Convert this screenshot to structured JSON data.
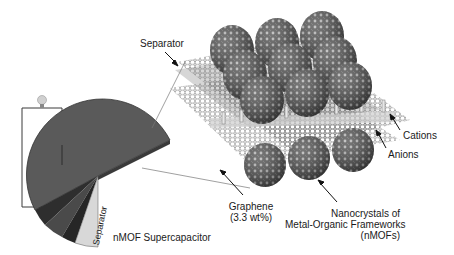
{
  "figure": {
    "device_label": "nMOF Supercapacitor",
    "separator_label_device": "Separator",
    "labels": {
      "separator": "Separator",
      "cations": "Cations",
      "anions": "Anions",
      "graphene_line1": "Graphene",
      "graphene_line2": "(3.3 wt%)",
      "nmof_line1": "Nanocrystals of",
      "nmof_line2": "Metal-Organic Frameworks",
      "nmof_line3": "(nMOFs)"
    },
    "icons": {
      "bulb": "light-bulb-icon",
      "circuit": "circuit-wire",
      "nmof_sphere": "nmof-sphere",
      "graphene_sheet": "graphene-sheet"
    },
    "colors": {
      "electrode": "#5a5a5a",
      "electrode_dark": "#2e2e2e",
      "separator_layer": "#d8d8d8",
      "sphere": "#555555",
      "sheet": "#9a9a9a",
      "text": "#1a1a1a"
    }
  }
}
